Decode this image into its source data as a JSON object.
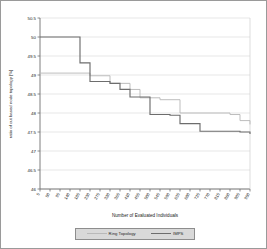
{
  "chart_data": {
    "type": "line",
    "subtype": "step",
    "title": "",
    "xlabel": "Number of Evaluated Individuals",
    "ylabel": "ratio of cut based node topology [%]",
    "ylim": [
      46,
      50.5
    ],
    "yticks": [
      "46",
      "46.5",
      "47",
      "47.5",
      "48",
      "48.5",
      "49",
      "49.5",
      "50",
      "50.5"
    ],
    "ytick_values": [
      46,
      46.5,
      47,
      47.5,
      48,
      48.5,
      49,
      49.5,
      50,
      50.5
    ],
    "grid": true,
    "grid_axis": "y",
    "legend_position": "below-axis",
    "xtick_labels": [
      "5",
      "50",
      "95",
      "140",
      "185",
      "230",
      "275",
      "320",
      "365",
      "410",
      "455",
      "500",
      "545",
      "590",
      "635",
      "680",
      "725",
      "770",
      "815",
      "860",
      "905",
      "950"
    ],
    "x_index": [
      0,
      1,
      2,
      3,
      4,
      5,
      6,
      7,
      8,
      9,
      10,
      11,
      12,
      13,
      14,
      15,
      16,
      17,
      18,
      19,
      20,
      21
    ],
    "series": [
      {
        "name": "Ring Topology",
        "color": "#b9b9b9",
        "values": [
          49.05,
          49.05,
          49.05,
          49.05,
          49.05,
          48.98,
          48.98,
          48.78,
          48.78,
          48.62,
          48.4,
          48.4,
          48.35,
          48.35,
          48.0,
          48.0,
          48.0,
          48.0,
          48.0,
          47.96,
          47.8,
          47.7
        ]
      },
      {
        "name": "IMPS",
        "color": "#6d6d6d",
        "values": [
          50.0,
          50.0,
          50.0,
          50.0,
          49.32,
          48.83,
          48.83,
          48.78,
          48.62,
          48.42,
          48.42,
          47.96,
          47.96,
          47.94,
          47.72,
          47.72,
          47.52,
          47.52,
          47.52,
          47.52,
          47.5,
          47.45
        ]
      }
    ]
  },
  "legend": {
    "items": [
      {
        "label": "Ring Topology"
      },
      {
        "label": "IMPS"
      }
    ]
  },
  "colors": {
    "series_light": "#b9b9b9",
    "series_dark": "#6d6d6d",
    "grid": "#d6d6d6",
    "axis": "#6f6f6f",
    "text": "#1a1a1a",
    "legend_background": "#d9d9d9",
    "legend_border": "#8d8d8d",
    "figure_border": "#9a9a9a"
  }
}
